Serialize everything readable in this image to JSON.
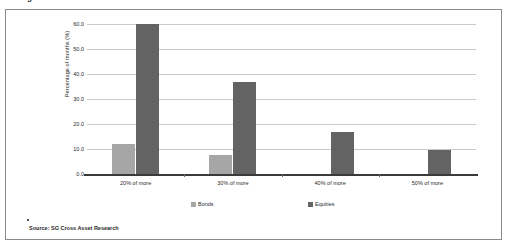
{
  "caption": {
    "text": "closing months of the of the of the the of the and of the on the of the"
  },
  "chart_data": {
    "type": "bar",
    "title": "",
    "xlabel": "",
    "ylabel": "Percentage of months (%)",
    "categories": [
      "20% of more",
      "30% of more",
      "40% of more",
      "50% of more"
    ],
    "series": [
      {
        "name": "Bonds",
        "color": "#a6a6a6",
        "values": [
          12.0,
          7.8,
          0,
          0
        ]
      },
      {
        "name": "Equities",
        "color": "#636363",
        "values": [
          60.0,
          36.8,
          17.0,
          9.7
        ]
      }
    ],
    "ylim": [
      0,
      60
    ],
    "yticks": [
      "0.0",
      "10.0",
      "20.0",
      "30.0",
      "40.0",
      "50.0",
      "60.0"
    ],
    "ytick_values": [
      0,
      10,
      20,
      30,
      40,
      50,
      60
    ],
    "grid": true,
    "legend_position": "bottom"
  },
  "source": {
    "label": "Source: SG Cross Asset Research"
  }
}
